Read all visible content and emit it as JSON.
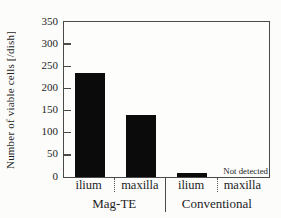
{
  "chart_data": {
    "type": "bar",
    "title": "",
    "ylabel": "Number of viable cells [/dish]",
    "xlabel": "",
    "ylim": [
      0,
      350
    ],
    "yticks": [
      0,
      50,
      100,
      150,
      200,
      250,
      300,
      350
    ],
    "grid": "off",
    "legend": "none",
    "categories": [
      "ilium",
      "maxilla",
      "ilium",
      "maxilla"
    ],
    "series": [
      {
        "name": "Number of viable cells",
        "values": [
          235,
          140,
          10,
          null
        ]
      }
    ],
    "groups": [
      {
        "label": "Mag-TE",
        "category_indices": [
          0,
          1
        ]
      },
      {
        "label": "Conventional",
        "category_indices": [
          2,
          3
        ]
      }
    ],
    "annotations": [
      {
        "text": "Not detected",
        "category": "Conventional maxilla",
        "placement": "just above x-axis, right-aligned to plot edge"
      }
    ],
    "bar_color": "#0b0b0b",
    "axis_color": "#4a4a4a",
    "text_color": "#1e1e1e",
    "background_color": "#fcfcfb"
  }
}
